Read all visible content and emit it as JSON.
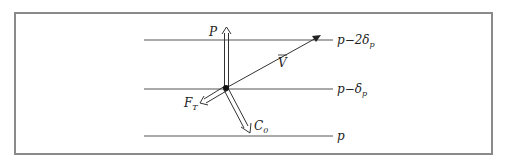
{
  "diagram": {
    "levels": [
      {
        "label_main": "p−2δ",
        "label_sub": "p",
        "y": 40
      },
      {
        "label_main": "p−δ",
        "label_sub": "p",
        "y": 89
      },
      {
        "label_main": "p",
        "label_sub": "",
        "y": 136
      }
    ],
    "vectors": {
      "P": {
        "label": "P"
      },
      "V": {
        "label": "V"
      },
      "F_T": {
        "label_main": "F",
        "label_sub": "T"
      },
      "C_0": {
        "label_main": "C",
        "label_sub": "0"
      }
    },
    "colors": {
      "line": "#555555",
      "frame": "#8a8a8a",
      "text": "#222222"
    }
  }
}
